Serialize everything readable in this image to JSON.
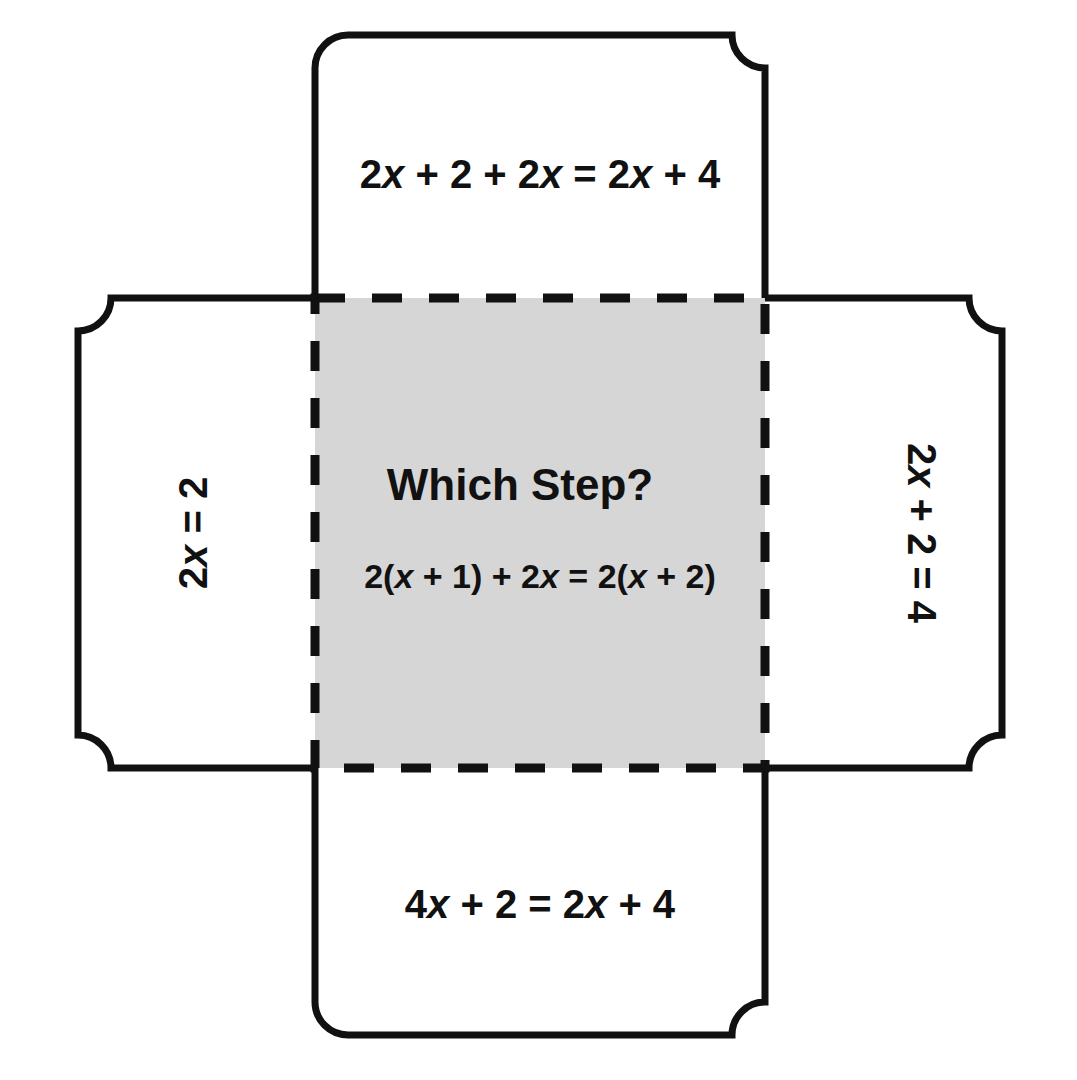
{
  "page": {
    "background_color": "#ffffff",
    "ink_color": "#111111",
    "center_fill_color": "#d6d6d6"
  },
  "center_panel": {
    "title": "Which Step?",
    "equation_prefix": "2(",
    "equation_var1": "x",
    "equation_mid1": " + 1) + 2",
    "equation_var2": "x",
    "equation_mid2": " = 2(",
    "equation_var3": "x",
    "equation_suffix": " + 2)",
    "equation_plain": "2(x + 1) + 2x = 2(x + 2)",
    "fill_color": "#d6d6d6",
    "border_style": "dashed"
  },
  "flaps": {
    "top": {
      "name": "top-flap",
      "equation_plain": "2x + 2 + 2x = 2x + 4",
      "seg1": "2",
      "var1": "x",
      "seg2": " + 2 + 2",
      "var2": "x",
      "seg3": " = 2",
      "var3": "x",
      "seg4": " + 4",
      "orientation": "horizontal"
    },
    "bottom": {
      "name": "bottom-flap",
      "equation_plain": "4x + 2 = 2x + 4",
      "seg1": "4",
      "var1": "x",
      "seg2": " + 2 = 2",
      "var2": "x",
      "seg3": " + 4",
      "orientation": "horizontal"
    },
    "left": {
      "name": "left-flap",
      "equation_plain": "2x = 2",
      "seg1": "2",
      "var1": "x",
      "seg2": " = 2",
      "orientation": "rotated-counterclockwise"
    },
    "right": {
      "name": "right-flap",
      "equation_plain": "2x + 2 = 4",
      "seg1": "2",
      "var1": "x",
      "seg2": " + 2 = 4",
      "orientation": "rotated-clockwise"
    }
  }
}
